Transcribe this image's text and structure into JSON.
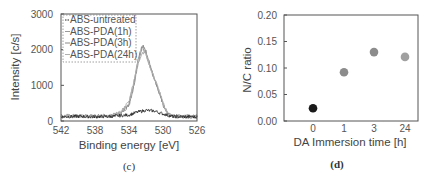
{
  "chart_data": [
    {
      "panel": "(c)",
      "type": "line",
      "title": "",
      "xlabel": "Binding energy [eV]",
      "ylabel": "Intensity [c/s]",
      "xlim": [
        542,
        526
      ],
      "ylim": [
        0,
        3000
      ],
      "x_ticks": [
        542,
        538,
        534,
        530,
        526
      ],
      "y_ticks": [
        0,
        1000,
        2000,
        3000
      ],
      "x_reversed": true,
      "grid": false,
      "legend": {
        "placement": "top-left",
        "border": "dashed",
        "entries": [
          "ABS-untreated",
          "ABS-PDA(1h)",
          "ABS-PDA(3h)",
          "ABS-PDA(24h)"
        ]
      },
      "series": [
        {
          "name": "ABS-untreated",
          "color": "#222222",
          "peak_center": 532.0,
          "peak_height": 300,
          "baseline": 120,
          "x": [
            542,
            540,
            538,
            536,
            534,
            533,
            532,
            531,
            530,
            529,
            528,
            526
          ],
          "y": [
            120,
            130,
            120,
            130,
            170,
            250,
            300,
            280,
            200,
            130,
            120,
            120
          ]
        },
        {
          "name": "ABS-PDA(1h)",
          "color": "#9a9a9a",
          "peak_center": 532.4,
          "peak_height": 2050,
          "baseline": 120,
          "x": [
            542,
            540,
            538,
            536,
            535,
            534,
            533.5,
            533,
            532.5,
            532.4,
            532,
            531.5,
            531,
            530.5,
            530,
            529.5,
            529,
            528,
            526
          ],
          "y": [
            130,
            130,
            130,
            140,
            200,
            450,
            900,
            1550,
            2000,
            2050,
            1900,
            1500,
            1150,
            800,
            450,
            200,
            140,
            120,
            120
          ]
        },
        {
          "name": "ABS-PDA(3h)",
          "color": "#8a8a8a",
          "peak_center": 532.3,
          "peak_height": 2100,
          "baseline": 130,
          "x": [
            542,
            540,
            538,
            536,
            535,
            534,
            533.5,
            533,
            532.5,
            532.3,
            532,
            531.5,
            531,
            530.5,
            530,
            529.5,
            529,
            528,
            526
          ],
          "y": [
            140,
            140,
            130,
            150,
            220,
            500,
            1000,
            1650,
            2080,
            2100,
            1950,
            1550,
            1200,
            850,
            480,
            220,
            150,
            130,
            130
          ]
        },
        {
          "name": "ABS-PDA(24h)",
          "color": "#b0b0b0",
          "peak_center": 532.2,
          "peak_height": 1950,
          "baseline": 130,
          "x": [
            542,
            540,
            538,
            536,
            535,
            534,
            533.5,
            533,
            532.5,
            532.2,
            532,
            531.5,
            531,
            530.5,
            530,
            529.5,
            529,
            528,
            526
          ],
          "y": [
            130,
            140,
            130,
            150,
            230,
            550,
            1050,
            1600,
            1900,
            1950,
            1880,
            1500,
            1200,
            880,
            500,
            230,
            150,
            130,
            130
          ]
        }
      ],
      "caption": "(c)"
    },
    {
      "panel": "(d)",
      "type": "scatter",
      "title": "",
      "xlabel": "DA Immersion time [h]",
      "ylabel": "N/C ratio",
      "categories": [
        "0",
        "1",
        "3",
        "24"
      ],
      "values": [
        0.024,
        0.092,
        0.13,
        0.121
      ],
      "point_colors": [
        "#1a1a1a",
        "#8c8c8c",
        "#8c8c8c",
        "#a0a0a0"
      ],
      "ylim": [
        0.0,
        0.2
      ],
      "y_ticks": [
        "0.00",
        "0.05",
        "0.10",
        "0.15",
        "0.20"
      ],
      "grid": false,
      "caption": "(d)"
    }
  ]
}
